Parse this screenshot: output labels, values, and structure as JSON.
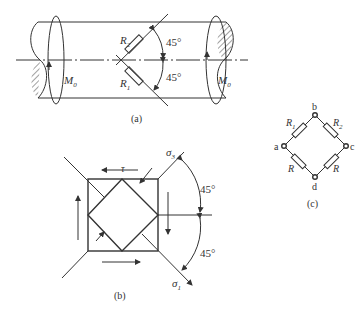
{
  "figure_a": {
    "caption": "(a)",
    "gauge_top": "R",
    "gauge_top_sub": "2",
    "gauge_bottom": "R",
    "gauge_bottom_sub": "1",
    "angle_top": "45°",
    "angle_bottom": "45°",
    "moment_left": "M",
    "moment_left_sub": "0",
    "moment_right": "M",
    "moment_right_sub": "0"
  },
  "figure_b": {
    "caption": "(b)",
    "shear_label": "τ",
    "sigma_top": "σ",
    "sigma_top_sub": "3",
    "sigma_bottom": "σ",
    "sigma_bottom_sub": "1",
    "angle_top": "45°",
    "angle_bottom": "45°"
  },
  "figure_c": {
    "caption": "(c)",
    "node_a": "a",
    "node_b": "b",
    "node_c": "c",
    "node_d": "d",
    "r1": "R",
    "r1_sub": "1",
    "r2": "R",
    "r2_sub": "2",
    "r3": "R",
    "r4": "R"
  }
}
